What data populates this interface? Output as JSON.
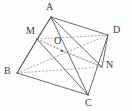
{
  "figure": {
    "background_color": "#fdfdfd",
    "solid_line_color": "#5a5a5a",
    "dashed_line_color": "#8e8e8e",
    "label_color": "#3c3c3c",
    "width": 132,
    "height": 111,
    "vertices": [
      {
        "id": "A",
        "label": "A",
        "x": 51,
        "y": 17,
        "label_x": 46,
        "label_y": 2
      },
      {
        "id": "M",
        "label": "M",
        "x": 37,
        "y": 39,
        "label_x": 26,
        "label_y": 26
      },
      {
        "id": "B",
        "label": "B",
        "x": 17,
        "y": 73,
        "label_x": 4,
        "label_y": 66
      },
      {
        "id": "C",
        "label": "C",
        "x": 88,
        "y": 95,
        "label_x": 85,
        "label_y": 98
      },
      {
        "id": "D",
        "label": "D",
        "x": 108,
        "y": 35,
        "label_x": 113,
        "label_y": 25
      },
      {
        "id": "N",
        "label": "N",
        "x": 102,
        "y": 67,
        "label_x": 106,
        "label_y": 60
      },
      {
        "id": "O",
        "label": "O",
        "x": 62,
        "y": 51,
        "label_x": 54,
        "label_y": 36
      }
    ],
    "edges_solid": [
      {
        "from": "A",
        "to": "M",
        "name": "edge-a-m"
      },
      {
        "from": "A",
        "to": "B",
        "name": "edge-a-b"
      },
      {
        "from": "A",
        "to": "C",
        "name": "edge-a-c"
      },
      {
        "from": "A",
        "to": "D",
        "name": "edge-a-d"
      },
      {
        "from": "A",
        "to": "N",
        "name": "edge-a-n"
      },
      {
        "from": "M",
        "to": "B",
        "name": "edge-m-b"
      },
      {
        "from": "M",
        "to": "C",
        "name": "edge-m-c"
      },
      {
        "from": "B",
        "to": "C",
        "name": "edge-b-c"
      },
      {
        "from": "D",
        "to": "C",
        "name": "edge-d-c"
      },
      {
        "from": "D",
        "to": "N",
        "name": "edge-d-n"
      }
    ],
    "edges_dashed": [
      {
        "from": "M",
        "to": "D",
        "name": "edge-m-d-hidden"
      },
      {
        "from": "M",
        "to": "N",
        "name": "edge-m-n-hidden"
      },
      {
        "from": "B",
        "to": "D",
        "name": "edge-b-d-hidden"
      },
      {
        "from": "B",
        "to": "N",
        "name": "edge-b-n-hidden"
      },
      {
        "from": "M",
        "to": "O",
        "name": "edge-m-o-hidden"
      },
      {
        "from": "O",
        "to": "N",
        "name": "edge-o-n-hidden"
      }
    ],
    "point_markers": [
      {
        "id": "O",
        "x": 62,
        "y": 51,
        "r": 1.1,
        "name": "point-marker-o"
      }
    ]
  }
}
